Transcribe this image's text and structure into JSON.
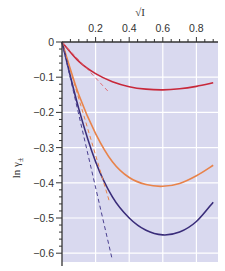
{
  "chart_data": {
    "type": "line",
    "title": "",
    "xlabel": "√I",
    "ylabel": "ln γ±",
    "xlim": [
      0,
      0.92
    ],
    "ylim": [
      -0.62,
      0
    ],
    "x_ticks": [
      "0.2",
      "0.4",
      "0.6",
      "0.8"
    ],
    "y_ticks": [
      "0",
      "-0.1",
      "-0.2",
      "-0.3",
      "-0.4",
      "-0.5",
      "-0.6"
    ],
    "grid": true,
    "legend": null,
    "series": [
      {
        "name": "red (z=1 extended)",
        "color": "#c8283a",
        "style": "solid",
        "x": [
          0,
          0.1,
          0.2,
          0.3,
          0.4,
          0.5,
          0.6,
          0.7,
          0.8,
          0.9
        ],
        "y": [
          0,
          -0.055,
          -0.09,
          -0.113,
          -0.127,
          -0.134,
          -0.136,
          -0.133,
          -0.126,
          -0.116
        ]
      },
      {
        "name": "orange (z=2 extended)",
        "color": "#e8834a",
        "style": "solid",
        "x": [
          0,
          0.1,
          0.2,
          0.3,
          0.4,
          0.5,
          0.6,
          0.7,
          0.8,
          0.9
        ],
        "y": [
          0,
          -0.15,
          -0.26,
          -0.34,
          -0.385,
          -0.405,
          -0.41,
          -0.402,
          -0.38,
          -0.35
        ]
      },
      {
        "name": "purple (z=3 extended)",
        "color": "#3a2d7a",
        "style": "solid",
        "x": [
          0,
          0.1,
          0.2,
          0.3,
          0.4,
          0.5,
          0.6,
          0.7,
          0.8,
          0.9
        ],
        "y": [
          0,
          -0.19,
          -0.34,
          -0.44,
          -0.5,
          -0.535,
          -0.548,
          -0.54,
          -0.51,
          -0.455
        ]
      },
      {
        "name": "red limiting law",
        "color": "#e0707a",
        "style": "dashed",
        "x": [
          0,
          0.28
        ],
        "y": [
          0,
          -0.143
        ]
      },
      {
        "name": "orange limiting law",
        "color": "#e8834a",
        "style": "dashed",
        "x": [
          0,
          0.28
        ],
        "y": [
          0,
          -0.45
        ]
      },
      {
        "name": "purple limiting law",
        "color": "#4a4090",
        "style": "dashed",
        "x": [
          0,
          0.3
        ],
        "y": [
          0,
          -0.62
        ]
      }
    ]
  },
  "labels": {
    "xlabel": "√I",
    "ylabel_main": "ln γ",
    "ylabel_sub": "±"
  }
}
